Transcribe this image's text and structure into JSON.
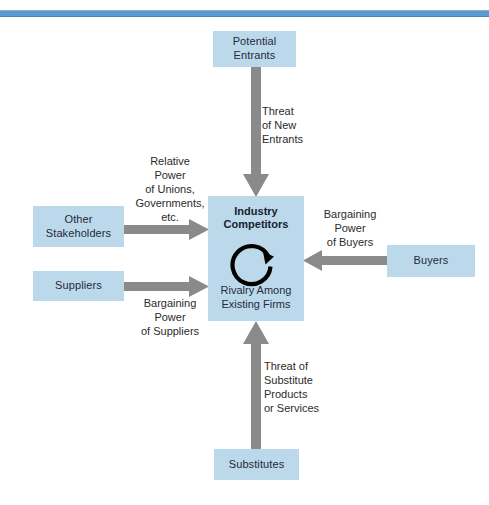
{
  "diagram": {
    "colors": {
      "box_fill": "#bcd9ec",
      "arrow_gray": "#8a8a8a",
      "rule_blue": "#5b9bd0",
      "text_dark": "#1e2b38"
    },
    "boxes": {
      "potential_entrants": "Potential\nEntrants",
      "other_stakeholders": "Other\nStakeholders",
      "suppliers": "Suppliers",
      "buyers": "Buyers",
      "substitutes": "Substitutes",
      "industry_competitors_title": "Industry\nCompetitors",
      "industry_competitors_subtitle": "Rivalry Among\nExisting Firms"
    },
    "labels": {
      "threat_of_new_entrants": "Threat\nof New\nEntrants",
      "relative_power_of_unions": "Relative\nPower\nof Unions,\nGovernments,\netc.",
      "bargaining_power_of_buyers": "Bargaining\nPower\nof Buyers",
      "bargaining_power_of_suppliers": "Bargaining\nPower\nof Suppliers",
      "threat_of_substitutes": "Threat of\nSubstitute\nProducts\nor Services"
    },
    "icons": {
      "rivalry_loop": "circular-arrow-icon",
      "arrow_down": "arrow-down-icon",
      "arrow_right": "arrow-right-icon",
      "arrow_left": "arrow-left-icon",
      "arrow_up": "arrow-up-icon"
    }
  }
}
